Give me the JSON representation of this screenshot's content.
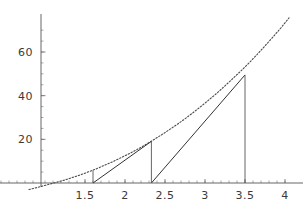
{
  "chart_data": {
    "type": "line",
    "title": "",
    "subtitle": "",
    "xlabel": "",
    "ylabel": "",
    "xlim": [
      0.95,
      4.05
    ],
    "ylim": [
      -4,
      78
    ],
    "grid": false,
    "legend": null,
    "x_ticks": [
      {
        "value": 1.5,
        "label": "1.5"
      },
      {
        "value": 2.0,
        "label": "2"
      },
      {
        "value": 2.5,
        "label": "2.5"
      },
      {
        "value": 3.0,
        "label": "3"
      },
      {
        "value": 3.5,
        "label": "3.5"
      },
      {
        "value": 4.0,
        "label": "4"
      }
    ],
    "y_ticks": [
      {
        "value": 20,
        "label": "20"
      },
      {
        "value": 40,
        "label": "40"
      },
      {
        "value": 60,
        "label": "60"
      }
    ],
    "x_minor_step": 0.1,
    "y_minor_step": 5,
    "series": [
      {
        "name": "curve",
        "style": "dotted",
        "description": "convex increasing curve",
        "points": [
          {
            "x": 0.8,
            "y": -3.0
          },
          {
            "x": 0.95,
            "y": -1.6
          },
          {
            "x": 1.05,
            "y": -0.6
          },
          {
            "x": 1.15,
            "y": 0.4
          },
          {
            "x": 1.25,
            "y": 1.4
          },
          {
            "x": 1.35,
            "y": 2.6
          },
          {
            "x": 1.45,
            "y": 3.8
          },
          {
            "x": 1.55,
            "y": 5.2
          },
          {
            "x": 1.65,
            "y": 6.6
          },
          {
            "x": 1.75,
            "y": 8.2
          },
          {
            "x": 1.85,
            "y": 9.8
          },
          {
            "x": 1.95,
            "y": 11.6
          },
          {
            "x": 2.05,
            "y": 13.4
          },
          {
            "x": 2.15,
            "y": 15.3
          },
          {
            "x": 2.25,
            "y": 17.4
          },
          {
            "x": 2.35,
            "y": 19.6
          },
          {
            "x": 2.45,
            "y": 21.9
          },
          {
            "x": 2.55,
            "y": 24.3
          },
          {
            "x": 2.65,
            "y": 26.8
          },
          {
            "x": 2.75,
            "y": 29.4
          },
          {
            "x": 2.85,
            "y": 32.2
          },
          {
            "x": 2.95,
            "y": 35.1
          },
          {
            "x": 3.05,
            "y": 38.1
          },
          {
            "x": 3.15,
            "y": 41.2
          },
          {
            "x": 3.25,
            "y": 44.5
          },
          {
            "x": 3.35,
            "y": 47.9
          },
          {
            "x": 3.45,
            "y": 51.4
          },
          {
            "x": 3.55,
            "y": 55.0
          },
          {
            "x": 3.65,
            "y": 58.8
          },
          {
            "x": 3.75,
            "y": 62.8
          },
          {
            "x": 3.85,
            "y": 66.9
          },
          {
            "x": 3.95,
            "y": 71.1
          },
          {
            "x": 4.05,
            "y": 75.6
          }
        ]
      },
      {
        "name": "secant-left",
        "style": "solid",
        "description": "straight chord from lower-left point to curve",
        "points": [
          {
            "x": 1.6,
            "y": 0.0
          },
          {
            "x": 2.33,
            "y": 19.1
          }
        ]
      },
      {
        "name": "secant-right",
        "style": "solid",
        "description": "straight chord rising to the 3.5 point",
        "points": [
          {
            "x": 2.33,
            "y": 0.0
          },
          {
            "x": 3.5,
            "y": 49.5
          }
        ]
      },
      {
        "name": "drop-left",
        "style": "solid",
        "description": "vertical drop line at x=1.6",
        "points": [
          {
            "x": 1.6,
            "y": 5.8
          },
          {
            "x": 1.6,
            "y": 0.0
          }
        ]
      },
      {
        "name": "drop-middle",
        "style": "solid",
        "description": "vertical drop line at x=2.33",
        "points": [
          {
            "x": 2.33,
            "y": 19.1
          },
          {
            "x": 2.33,
            "y": 0.0
          }
        ]
      },
      {
        "name": "drop-right",
        "style": "solid",
        "description": "vertical drop line at x=3.5",
        "points": [
          {
            "x": 3.5,
            "y": 49.5
          },
          {
            "x": 3.5,
            "y": 0.0
          }
        ]
      }
    ],
    "colors": {
      "curve": "#4a4a4a",
      "secant": "#333333",
      "axis": "#555555",
      "text": "#3a3a3a",
      "background": "#ffffff"
    }
  }
}
